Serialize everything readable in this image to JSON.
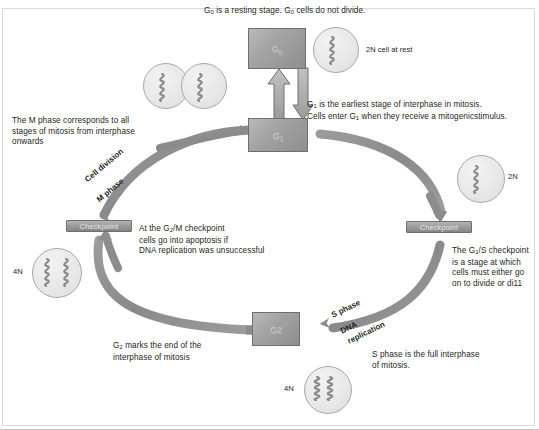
{
  "diagram": {
    "title_caption": "G0 is a resting stage. G0 cells do not divide.",
    "phases": [
      {
        "id": "g0",
        "label": "G0"
      },
      {
        "id": "g1",
        "label": "G1"
      },
      {
        "id": "g2",
        "label": "G2"
      }
    ],
    "checkpoints": [
      {
        "id": "g2m",
        "label": "Checkpoint"
      },
      {
        "id": "g1s",
        "label": "Checkpoint"
      }
    ],
    "arc_labels": [
      {
        "id": "cell-division",
        "label": "Cell division"
      },
      {
        "id": "m-phase",
        "label": "M phase"
      },
      {
        "id": "s-phase",
        "label": "S phase"
      },
      {
        "id": "dna-replication-1",
        "label": "DNA"
      },
      {
        "id": "dna-replication-2",
        "label": "replication"
      }
    ],
    "cells": [
      {
        "id": "dividing-pair",
        "ploidy": ""
      },
      {
        "id": "resting-2n",
        "ploidy": "2N"
      },
      {
        "id": "g1s-2n",
        "ploidy": "2N"
      },
      {
        "id": "g2m-4n",
        "ploidy": "4N"
      },
      {
        "id": "s-phase-4n",
        "ploidy": "4N"
      }
    ],
    "captions": {
      "top": "G0 is a resting stage. G0 cells do not divide.",
      "resting_cell": "2N cell at rest",
      "g1_description_line1": "G1 is the earliest stage of interphase in mitosis.",
      "g1_description_line2": "Cells enter G1 when they receive a mitogenicstimulus.",
      "m_phase_description": "The M phase corresponds to all\nstages of mitosis from interphase\nonwards",
      "g2m_checkpoint_description": "At the G2/M checkpoint\ncells go into apoptosis if\nDNA replication was unsuccessful",
      "g1s_checkpoint_description": "The G1/S checkpoint\nis a stage at which\ncells must either go\non to divide or di11",
      "g2_description": "G2 marks the end of the\ninterphase of mitosis",
      "s_phase_description": "S phase is the full interphase\nof mitosis."
    }
  },
  "colors": {
    "text": "#231f20",
    "arc": "#8c8c8c",
    "box_fill": "#a3a3a3",
    "box_stroke": "#6f6f6f",
    "cell_fill": "#e8e8e8",
    "dna": "#8a8a8a"
  }
}
